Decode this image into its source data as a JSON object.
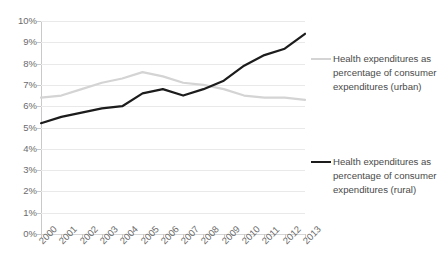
{
  "chart_data": {
    "type": "line",
    "title": "",
    "subtitle": "",
    "xlabel": "",
    "ylabel": "",
    "categories": [
      "2000",
      "2001",
      "2002",
      "2003",
      "2004",
      "2005",
      "2006",
      "2007",
      "2008",
      "2009",
      "2010",
      "2011",
      "2012",
      "2013"
    ],
    "ylim": [
      0,
      10
    ],
    "ytick_step": 1,
    "ytick_labels": [
      "0%",
      "1%",
      "2%",
      "3%",
      "4%",
      "5%",
      "6%",
      "7%",
      "8%",
      "9%",
      "10%"
    ],
    "ytick_values": [
      0,
      1,
      2,
      3,
      4,
      5,
      6,
      7,
      8,
      9,
      10
    ],
    "grid": true,
    "grid_axis": "y",
    "legend_position": "right",
    "value_unit": "%",
    "series": [
      {
        "name": "Health expenditures as percentage of consumer expenditures (urban)",
        "short_name": "urban",
        "color": "#d4d4d4",
        "width": 2.2,
        "values": [
          6.4,
          6.5,
          6.8,
          7.1,
          7.3,
          7.6,
          7.4,
          7.1,
          7.0,
          6.8,
          6.5,
          6.4,
          6.4,
          6.3
        ]
      },
      {
        "name": "Health expenditures as percentage of consumer expenditures (rural)",
        "short_name": "rural",
        "color": "#1c1c1c",
        "width": 2.2,
        "values": [
          5.2,
          5.5,
          5.7,
          5.9,
          6.0,
          6.6,
          6.8,
          6.5,
          6.8,
          7.2,
          7.9,
          8.4,
          8.7,
          9.4
        ]
      }
    ]
  },
  "legend": {
    "entries": [
      {
        "label": "Health expenditures as percentage of consumer expenditures (urban)",
        "color": "#d4d4d4"
      },
      {
        "label": "Health expenditures as percentage of consumer expenditures (rural)",
        "color": "#1c1c1c"
      }
    ]
  }
}
